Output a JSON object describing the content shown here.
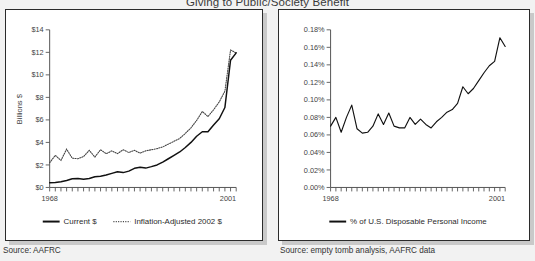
{
  "figure": {
    "title": "Giving to Public/Society Benefit"
  },
  "panels": {
    "left": {
      "source": "Source: AAFRC",
      "ylabel": "Billions $",
      "xmin_label": "1968",
      "xmax_label": "2001",
      "ytick_labels": [
        "$0",
        "$2",
        "$4",
        "$6",
        "$8",
        "$10",
        "$12",
        "$14"
      ],
      "legend": [
        {
          "label": "Current $",
          "style": "solid"
        },
        {
          "label": "Inflation-Adjusted 2002 $",
          "style": "dotted"
        }
      ]
    },
    "right": {
      "source": "Source: empty tomb analysis, AAFRC data",
      "ylabel": "",
      "xmin_label": "1968",
      "xmax_label": "2001",
      "ytick_labels": [
        "0.00%",
        "0.02%",
        "0.04%",
        "0.06%",
        "0.08%",
        "0.10%",
        "0.12%",
        "0.14%",
        "0.16%",
        "0.18%"
      ],
      "legend": [
        {
          "label": "% of U.S. Disposable Personal Income",
          "style": "solid"
        }
      ]
    }
  },
  "chart_data": [
    {
      "type": "line",
      "id": "giving-billions",
      "title": "Giving to Public/Society Benefit",
      "xlabel": "",
      "ylabel": "Billions $",
      "xlim": [
        1968,
        2001
      ],
      "ylim": [
        0,
        14
      ],
      "ytick_step": 2,
      "grid": false,
      "legend_position": "bottom",
      "x": [
        1968,
        1969,
        1970,
        1971,
        1972,
        1973,
        1974,
        1975,
        1976,
        1977,
        1978,
        1979,
        1980,
        1981,
        1982,
        1983,
        1984,
        1985,
        1986,
        1987,
        1988,
        1989,
        1990,
        1991,
        1992,
        1993,
        1994,
        1995,
        1996,
        1997,
        1998,
        1999,
        2000,
        2001
      ],
      "series": [
        {
          "name": "Current $",
          "style": "solid",
          "values": [
            0.42,
            0.45,
            0.5,
            0.62,
            0.78,
            0.8,
            0.72,
            0.8,
            0.95,
            1.0,
            1.1,
            1.25,
            1.4,
            1.32,
            1.45,
            1.7,
            1.8,
            1.72,
            1.85,
            2.0,
            2.25,
            2.55,
            2.85,
            3.15,
            3.55,
            4.0,
            4.55,
            4.95,
            4.95,
            5.55,
            6.1,
            7.1,
            11.3,
            11.95
          ]
        },
        {
          "name": "Inflation-Adjusted 2002 $",
          "style": "dotted",
          "values": [
            2.2,
            2.85,
            2.4,
            3.4,
            2.6,
            2.55,
            2.75,
            3.3,
            2.7,
            3.35,
            3.0,
            3.25,
            3.0,
            3.35,
            3.1,
            3.3,
            3.05,
            3.25,
            3.35,
            3.45,
            3.6,
            3.85,
            4.1,
            4.35,
            4.8,
            5.3,
            5.95,
            6.75,
            6.3,
            6.9,
            7.6,
            8.55,
            12.2,
            11.95
          ]
        }
      ]
    },
    {
      "type": "line",
      "id": "giving-pct-dpi",
      "title": "Giving to Public/Society Benefit",
      "xlabel": "",
      "ylabel": "% of U.S. Disposable Personal Income",
      "xlim": [
        1968,
        2001
      ],
      "ylim": [
        0.0,
        0.18
      ],
      "ytick_step": 0.02,
      "grid": false,
      "legend_position": "bottom",
      "x": [
        1968,
        1969,
        1970,
        1971,
        1972,
        1973,
        1974,
        1975,
        1976,
        1977,
        1978,
        1979,
        1980,
        1981,
        1982,
        1983,
        1984,
        1985,
        1986,
        1987,
        1988,
        1989,
        1990,
        1991,
        1992,
        1993,
        1994,
        1995,
        1996,
        1997,
        1998,
        1999,
        2000,
        2001
      ],
      "series": [
        {
          "name": "% of U.S. Disposable Personal Income",
          "style": "solid",
          "values": [
            0.07,
            0.08,
            0.063,
            0.08,
            0.094,
            0.067,
            0.062,
            0.063,
            0.07,
            0.084,
            0.072,
            0.085,
            0.07,
            0.068,
            0.068,
            0.08,
            0.072,
            0.078,
            0.072,
            0.068,
            0.075,
            0.08,
            0.086,
            0.089,
            0.096,
            0.115,
            0.107,
            0.113,
            0.122,
            0.131,
            0.139,
            0.144,
            0.171,
            0.161
          ]
        }
      ]
    }
  ]
}
